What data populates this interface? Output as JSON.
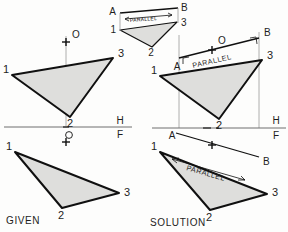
{
  "figure": {
    "title_given": "GIVEN",
    "title_solution": "SOLUTION",
    "reference_line": {
      "upper_label": "H",
      "lower_label": "F"
    },
    "colors": {
      "triangle_fill": "#dededc",
      "edge": "#101010",
      "reference_line": "#6f6f6f",
      "projector": "#9a9a9a",
      "background": "#fdfdfc"
    }
  },
  "views": {
    "given_top": {
      "name": "given-top-view",
      "vertices": [
        {
          "id": "1",
          "label": "1",
          "x": 12,
          "y": 75
        },
        {
          "id": "3",
          "label": "3",
          "x": 113,
          "y": 58
        },
        {
          "id": "2",
          "label": "2",
          "x": 70,
          "y": 117
        }
      ],
      "point_o": {
        "label": "O",
        "x": 66,
        "y": 42
      }
    },
    "given_front": {
      "name": "given-front-view",
      "vertices": [
        {
          "id": "1",
          "label": "1",
          "x": 15,
          "y": 152
        },
        {
          "id": "3",
          "label": "3",
          "x": 119,
          "y": 193
        },
        {
          "id": "2",
          "label": "2",
          "x": 62,
          "y": 208
        }
      ],
      "point_o": {
        "label": "O",
        "x": 66,
        "y": 142
      }
    },
    "solution_aux": {
      "name": "solution-auxiliary-view",
      "vertices": [
        {
          "id": "1",
          "label": "1",
          "x": 120,
          "y": 30
        },
        {
          "id": "3",
          "label": "3",
          "x": 177,
          "y": 22
        },
        {
          "id": "2",
          "label": "2",
          "x": 152,
          "y": 45
        }
      ],
      "line_a": {
        "label": "A",
        "x": 120,
        "y": 11
      },
      "line_b": {
        "label": "B",
        "x": 180,
        "y": 8
      },
      "parallel_note": "PARALLEL"
    },
    "solution_top": {
      "name": "solution-top-view",
      "vertices": [
        {
          "id": "1",
          "label": "1",
          "x": 160,
          "y": 76
        },
        {
          "id": "3",
          "label": "3",
          "x": 262,
          "y": 60
        },
        {
          "id": "2",
          "label": "2",
          "x": 219,
          "y": 119
        }
      ],
      "line_a": {
        "label": "A",
        "x": 179,
        "y": 62
      },
      "line_b": {
        "label": "B",
        "x": 260,
        "y": 40
      },
      "point_o": {
        "label": "O",
        "x": 213,
        "y": 41
      },
      "parallel_note": "PARALLEL"
    },
    "solution_front": {
      "name": "solution-front-view",
      "vertices": [
        {
          "id": "1",
          "label": "1",
          "x": 160,
          "y": 152
        },
        {
          "id": "3",
          "label": "3",
          "x": 267,
          "y": 194
        },
        {
          "id": "2",
          "label": "2",
          "x": 210,
          "y": 210
        }
      ],
      "line_a": {
        "label": "A",
        "x": 175,
        "y": 136
      },
      "line_b": {
        "label": "B",
        "x": 260,
        "y": 160
      },
      "parallel_note": "PARALLEL"
    }
  },
  "annotations": {
    "parallel": "PARALLEL",
    "vertex_1": "1",
    "vertex_2": "2",
    "vertex_3": "3",
    "point_a": "A",
    "point_b": "B",
    "point_o": "O",
    "plane_h": "H",
    "plane_f": "F"
  }
}
